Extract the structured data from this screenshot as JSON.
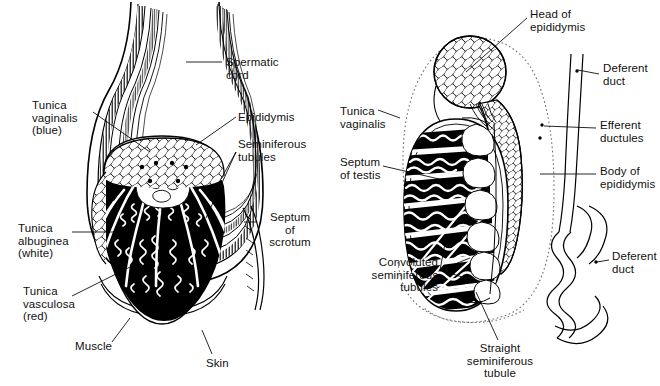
{
  "figure": {
    "width": 660,
    "height": 386,
    "background": "#ffffff",
    "ink": "#000000"
  },
  "left_diagram": {
    "name": "scrotum-and-testis-coronal-section",
    "labels": [
      {
        "id": "spermatic-cord",
        "text": "Spermatic\ncord",
        "x": 226,
        "y": 56,
        "align": "l"
      },
      {
        "id": "tunica-vaginalis",
        "text": "Tunica\nvaginalis\n(blue)",
        "x": 32,
        "y": 99,
        "align": "l"
      },
      {
        "id": "epididymis",
        "text": "Epididymis",
        "x": 238,
        "y": 111,
        "align": "l"
      },
      {
        "id": "seminiferous-tubules",
        "text": "Seminiferous\ntubules",
        "x": 238,
        "y": 138,
        "align": "l"
      },
      {
        "id": "tunica-albuginea",
        "text": "Tunica\nalbuginea\n(white)",
        "x": 18,
        "y": 222,
        "align": "l"
      },
      {
        "id": "septum-of-scrotum",
        "text": "Septum\nof\nscrotum",
        "x": 259,
        "y": 211,
        "align": "c"
      },
      {
        "id": "tunica-vasculosa",
        "text": "Tunica\nvasculosa\n(red)",
        "x": 23,
        "y": 285,
        "align": "l"
      },
      {
        "id": "muscle",
        "text": "Muscle",
        "x": 75,
        "y": 340,
        "align": "l"
      },
      {
        "id": "skin",
        "text": "Skin",
        "x": 206,
        "y": 357,
        "align": "l"
      }
    ]
  },
  "right_diagram": {
    "name": "testis-and-epididymis-sagittal-section",
    "labels": [
      {
        "id": "head-of-epididymis",
        "text": "Head of\nepididymis",
        "x": 530,
        "y": 8,
        "align": "l"
      },
      {
        "id": "deferent-duct-upper",
        "text": "Deferent\nduct",
        "x": 603,
        "y": 62,
        "align": "l"
      },
      {
        "id": "tunica-vaginalis-right",
        "text": "Tunica\nvaginalis",
        "x": 340,
        "y": 105,
        "align": "l"
      },
      {
        "id": "efferent-ductules",
        "text": "Efferent\nductules",
        "x": 600,
        "y": 119,
        "align": "l"
      },
      {
        "id": "septum-of-testis",
        "text": "Septum\nof testis",
        "x": 340,
        "y": 156,
        "align": "l"
      },
      {
        "id": "body-of-epididymis",
        "text": "Body of\nepididymis",
        "x": 600,
        "y": 165,
        "align": "l"
      },
      {
        "id": "deferent-duct-lower",
        "text": "Deferent\nduct",
        "x": 612,
        "y": 250,
        "align": "l"
      },
      {
        "id": "convoluted-seminiferous-tubules",
        "text": "Convoluted\nseminiferous\ntubules",
        "x": 348,
        "y": 256,
        "align": "r",
        "width": 90
      },
      {
        "id": "straight-seminiferous-tubule",
        "text": "Straight\nseminiferous\ntubule",
        "x": 452,
        "y": 342,
        "align": "c",
        "width": 96
      }
    ]
  },
  "colors": {
    "line": "#000000",
    "fill_dark": "#000000",
    "fill_light": "#ffffff",
    "hatch": "#2a2a2a",
    "stipple": "#555555",
    "dotted_outline": "#777777"
  }
}
